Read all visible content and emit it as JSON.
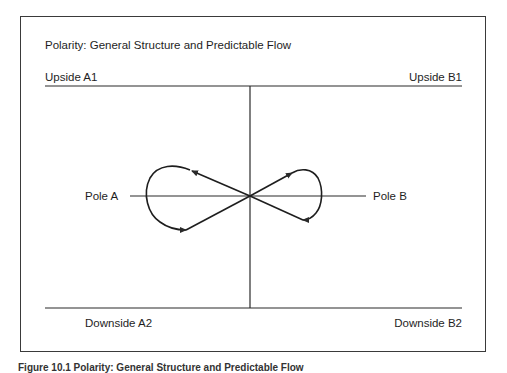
{
  "diagram": {
    "title": "Polarity: General Structure and Predictable Flow",
    "quadrant_labels": {
      "upside_a": "Upside A1",
      "upside_b": "Upside B1",
      "downside_a": "Downside A2",
      "downside_b": "Downside B2"
    },
    "poles": {
      "left": "Pole A",
      "right": "Pole B"
    },
    "flow": [
      "Upside A1",
      "Upside B1",
      "Downside B2",
      "Downside A2",
      "Upside A1"
    ],
    "shape": "infinity loop"
  },
  "caption": "Figure 10.1 Polarity: General Structure and Predictable Flow",
  "colors": {
    "line": "#2a2a2a",
    "text": "#1e1e1e",
    "background": "#ffffff"
  }
}
